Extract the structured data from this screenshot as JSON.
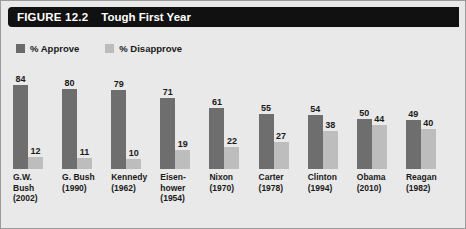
{
  "figure": {
    "number": "FIGURE 12.2",
    "title": "Tough First Year"
  },
  "legend": {
    "items": [
      {
        "label": "% Approve",
        "color": "#6a6a6a",
        "key": "approve"
      },
      {
        "label": "% Disapprove",
        "color": "#bcbcbc",
        "key": "disapprove"
      }
    ]
  },
  "colors": {
    "background": "#e9e9e9",
    "title_bar": "#111111",
    "title_text": "#ffffff",
    "approve_bar": "#6e6e6e",
    "disapprove_bar": "#bdbdbd",
    "border": "#9b9b9b",
    "text": "#1a1a1a"
  },
  "chart_data": {
    "type": "bar",
    "title": "Tough First Year",
    "xlabel": "",
    "ylabel": "",
    "ylim": [
      0,
      100
    ],
    "grid": false,
    "legend_position": "top-left",
    "categories": [
      "G.W. Bush (2002)",
      "G. Bush (1990)",
      "Kennedy (1962)",
      "Eisenhower (1954)",
      "Nixon (1970)",
      "Carter (1978)",
      "Clinton (1994)",
      "Obama (2010)",
      "Reagan (1982)"
    ],
    "category_lines": [
      [
        "G.W.",
        "Bush",
        "(2002)"
      ],
      [
        "G. Bush",
        "(1990)"
      ],
      [
        "Kennedy",
        "(1962)"
      ],
      [
        "Eisen-",
        "hower",
        "(1954)"
      ],
      [
        "Nixon",
        "(1970)"
      ],
      [
        "Carter",
        "(1978)"
      ],
      [
        "Clinton",
        "(1994)"
      ],
      [
        "Obama",
        "(2010)"
      ],
      [
        "Reagan",
        "(1982)"
      ]
    ],
    "series": [
      {
        "name": "% Approve",
        "values": [
          84,
          80,
          79,
          71,
          61,
          55,
          54,
          50,
          49
        ]
      },
      {
        "name": "% Disapprove",
        "values": [
          12,
          11,
          10,
          19,
          22,
          27,
          38,
          44,
          40
        ]
      }
    ]
  }
}
